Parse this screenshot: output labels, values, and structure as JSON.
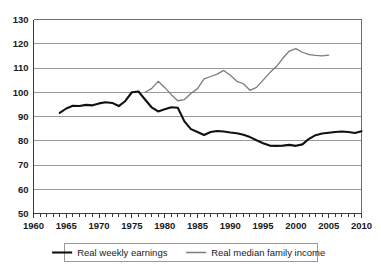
{
  "chart_data": {
    "type": "line",
    "title": "",
    "subtitle": "",
    "xlabel": "",
    "ylabel": "",
    "xlim": [
      1960,
      2010
    ],
    "ylim": [
      50,
      130
    ],
    "ytick_labels": [
      "50",
      "60",
      "70",
      "80",
      "90",
      "100",
      "110",
      "120",
      "130"
    ],
    "ytick_values": [
      50,
      60,
      70,
      80,
      90,
      100,
      110,
      120,
      130
    ],
    "xtick_labels": [
      "1960",
      "1965",
      "1970",
      "1975",
      "1980",
      "1985",
      "1990",
      "1995",
      "2000",
      "2005",
      "2010"
    ],
    "xtick_values": [
      1960,
      1965,
      1970,
      1975,
      1980,
      1985,
      1990,
      1995,
      2000,
      2005,
      2010
    ],
    "minor_xtick_step": 1,
    "grid": "horizontal",
    "legend_position": "bottom",
    "series": [
      {
        "name": "Real weekly earnings",
        "color": "#111111",
        "style": "thick",
        "x": [
          1964,
          1965,
          1966,
          1967,
          1968,
          1969,
          1970,
          1971,
          1972,
          1973,
          1974,
          1975,
          1976,
          1977,
          1978,
          1979,
          1980,
          1981,
          1982,
          1983,
          1984,
          1985,
          1986,
          1987,
          1988,
          1989,
          1990,
          1991,
          1992,
          1993,
          1994,
          1995,
          1996,
          1997,
          1998,
          1999,
          2000,
          2001,
          2002,
          2003,
          2004,
          2005
        ],
        "values": [
          91.5,
          93.3,
          94.4,
          94.3,
          94.8,
          94.6,
          95.4,
          95.9,
          95.6,
          94.3,
          96.4,
          100.0,
          100.3,
          97.0,
          93.8,
          92.1,
          93.0,
          93.8,
          93.6,
          88.0,
          84.8,
          83.6,
          82.4,
          83.6,
          84.0,
          83.8,
          83.4,
          83.1,
          82.5,
          81.5,
          80.2,
          79.0,
          78.0,
          77.9,
          78.0,
          78.3,
          77.9,
          78.5,
          80.8,
          82.3,
          83.0,
          83.3
        ],
        "values_tail": [
          83.6,
          83.8,
          83.6,
          83.2,
          83.9
        ]
      },
      {
        "name": "Real median family income",
        "color": "#7c7c7c",
        "style": "thin",
        "x": [
          1977,
          1978,
          1979,
          1980,
          1981,
          1982,
          1983,
          1984,
          1985,
          1986,
          1987,
          1988,
          1989,
          1990,
          1991,
          1992,
          1993,
          1994,
          1995,
          1996,
          1997,
          1998,
          1999,
          2000,
          2001,
          2002,
          2003,
          2004,
          2005
        ],
        "values": [
          100.0,
          101.5,
          104.5,
          102.0,
          99.0,
          96.5,
          97.0,
          99.5,
          101.5,
          105.5,
          106.5,
          107.5,
          109.0,
          107.0,
          104.5,
          103.5,
          100.8,
          102.0,
          105.0,
          108.0,
          110.5,
          114.0,
          117.0,
          118.0,
          116.5,
          115.5,
          115.2,
          115.0,
          115.3
        ]
      }
    ]
  },
  "legend": {
    "entries": [
      {
        "label": "Real weekly earnings"
      },
      {
        "label": "Real median family income"
      }
    ]
  }
}
